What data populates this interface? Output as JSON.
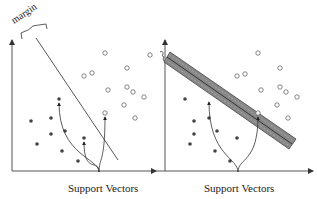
{
  "diagram": {
    "panels": [
      {
        "id": "small-margin",
        "margin_label": "margin",
        "caption": "Support Vectors",
        "axes": {
          "origin": [
            12,
            171
          ],
          "x_end": [
            156,
            171
          ],
          "y_end": [
            12,
            40
          ]
        },
        "boundary": {
          "from": [
            36,
            38
          ],
          "to": [
            118,
            160
          ]
        },
        "brace": {
          "from": [
            22,
            32
          ],
          "to": [
            46,
            24
          ]
        },
        "class_a_filled": [
          [
            59,
            99
          ],
          [
            31,
            121
          ],
          [
            51,
            118
          ],
          [
            51,
            134
          ],
          [
            65,
            131
          ],
          [
            37,
            144
          ],
          [
            62,
            151
          ],
          [
            78,
            161
          ],
          [
            84,
            138
          ]
        ],
        "class_b_open": [
          [
            105,
            53
          ],
          [
            84,
            76
          ],
          [
            92,
            73
          ],
          [
            127,
            68
          ],
          [
            108,
            90
          ],
          [
            127,
            87
          ],
          [
            133,
            92
          ],
          [
            144,
            97
          ],
          [
            124,
            105
          ],
          [
            135,
            118
          ],
          [
            105,
            113
          ],
          [
            150,
            55
          ]
        ],
        "support_vectors": [
          [
            59,
            99
          ],
          [
            84,
            138
          ],
          [
            105,
            113
          ]
        ],
        "arrow_root": [
          99,
          172
        ]
      },
      {
        "id": "large-margin",
        "caption": "Support Vectors",
        "axes": {
          "origin": [
            165,
            171
          ],
          "x_end": [
            313,
            171
          ],
          "y_end": [
            165,
            40
          ]
        },
        "band": {
          "from": [
            167,
            57
          ],
          "to": [
            292,
            144
          ],
          "half_width": 6
        },
        "brace": {
          "from": [
            160,
            52
          ],
          "to": [
            167,
            58
          ]
        },
        "class_a_filled": [
          [
            185,
            99
          ],
          [
            209,
            118
          ],
          [
            194,
            121
          ],
          [
            194,
            134
          ],
          [
            217,
            131
          ],
          [
            190,
            144
          ],
          [
            215,
            151
          ],
          [
            230,
            161
          ],
          [
            237,
            138
          ]
        ],
        "class_b_open": [
          [
            258,
            53
          ],
          [
            237,
            76
          ],
          [
            245,
            74
          ],
          [
            280,
            68
          ],
          [
            261,
            90
          ],
          [
            280,
            87
          ],
          [
            286,
            92
          ],
          [
            297,
            97
          ],
          [
            277,
            105
          ],
          [
            288,
            118
          ],
          [
            258,
            113
          ]
        ],
        "support_vectors": [
          [
            209,
            98
          ],
          [
            258,
            113
          ]
        ],
        "arrow_root": [
          238,
          172
        ]
      }
    ]
  }
}
